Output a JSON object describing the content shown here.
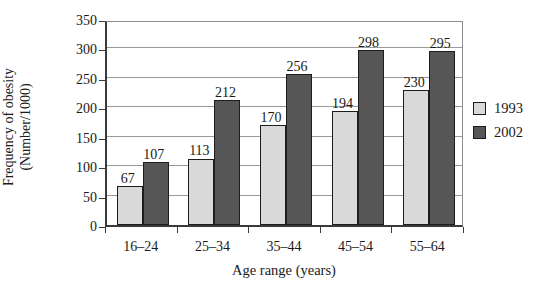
{
  "chart_data": {
    "type": "bar",
    "title": "",
    "categories": [
      "16–24",
      "25–34",
      "35–44",
      "45–54",
      "55–64"
    ],
    "series": [
      {
        "name": "1993",
        "color": "#d9d9d9",
        "values": [
          67,
          113,
          170,
          194,
          230
        ]
      },
      {
        "name": "2002",
        "color": "#565656",
        "values": [
          107,
          212,
          256,
          298,
          295
        ]
      }
    ],
    "xlabel": "Age range (years)",
    "ylabel": "Frequency of obesity (Number/1000)",
    "ylabel_line1": "Frequency of obesity",
    "ylabel_line2": "(Number/1000)",
    "ylim": [
      0,
      350
    ],
    "ytick_step": 50,
    "grid": true,
    "legend_position": "right",
    "legend": [
      "1993",
      "2002"
    ]
  },
  "colors": {
    "axis": "#3a3a3a",
    "gridline": "#9a9a9a",
    "text": "#1a1a1a",
    "background": "#ffffff"
  }
}
